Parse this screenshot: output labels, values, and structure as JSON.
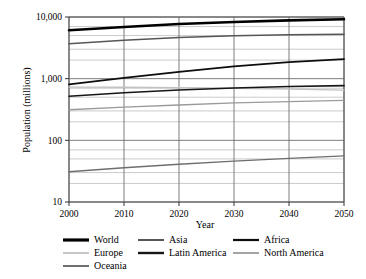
{
  "chart_data": {
    "type": "line",
    "title": "",
    "xlabel": "Year",
    "ylabel": "Population (millions)",
    "x": [
      2000,
      2010,
      2020,
      2030,
      2040,
      2050
    ],
    "xlim": [
      2000,
      2050
    ],
    "xticks": [
      2000,
      2010,
      2020,
      2030,
      2040,
      2050
    ],
    "xtick_labels": [
      "2000",
      "2010",
      "2020",
      "2030",
      "2040",
      "2050"
    ],
    "yscale": "log",
    "ylim": [
      10,
      10000
    ],
    "yticks": [
      10,
      100,
      1000,
      10000
    ],
    "ytick_labels": [
      "10",
      "100",
      "1,000",
      "10,000"
    ],
    "grid": true,
    "grid_color": "#808080",
    "legend_position": "below",
    "legend_columns": 3,
    "series": [
      {
        "name": "World",
        "color": "#000000",
        "width": 2.6,
        "values": [
          6100,
          6900,
          7700,
          8300,
          8800,
          9200
        ]
      },
      {
        "name": "Asia",
        "color": "#565656",
        "width": 1.5,
        "values": [
          3700,
          4200,
          4650,
          4950,
          5150,
          5250
        ]
      },
      {
        "name": "Africa",
        "color": "#0d0d0d",
        "width": 1.8,
        "values": [
          810,
          1030,
          1290,
          1580,
          1850,
          2080
        ]
      },
      {
        "name": "Europe",
        "color": "#c2c2c2",
        "width": 1.4,
        "values": [
          728,
          725,
          715,
          700,
          678,
          653
        ]
      },
      {
        "name": "Latin America",
        "color": "#161616",
        "width": 1.6,
        "values": [
          520,
          590,
          655,
          705,
          745,
          770
        ]
      },
      {
        "name": "North America",
        "color": "#9a9a9a",
        "width": 1.4,
        "values": [
          314,
          345,
          375,
          405,
          425,
          445
        ]
      },
      {
        "name": "Oceania",
        "color": "#6e6e6e",
        "width": 1.4,
        "values": [
          31,
          36,
          41,
          46,
          51,
          56
        ]
      }
    ]
  },
  "legend": {
    "entries": [
      {
        "label": "World",
        "color": "#000000",
        "width": 3.2
      },
      {
        "label": "Asia",
        "color": "#565656",
        "width": 2.0
      },
      {
        "label": "Africa",
        "color": "#0d0d0d",
        "width": 2.2
      },
      {
        "label": "Europe",
        "color": "#c2c2c2",
        "width": 1.8
      },
      {
        "label": "Latin America",
        "color": "#161616",
        "width": 2.4
      },
      {
        "label": "North America",
        "color": "#9a9a9a",
        "width": 1.8
      },
      {
        "label": "Oceania",
        "color": "#6e6e6e",
        "width": 2.0
      }
    ]
  }
}
